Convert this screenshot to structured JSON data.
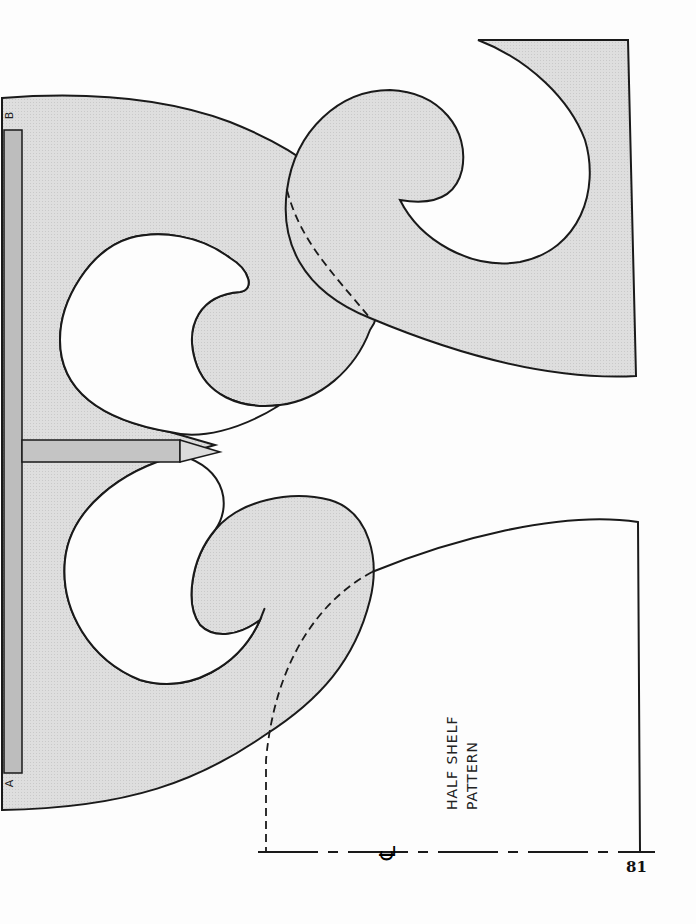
{
  "page": {
    "number": "81",
    "pattern_label_lines": [
      "HALF SHELF",
      "PATTERN"
    ],
    "edge_marks": {
      "top": "B",
      "bottom": "A"
    },
    "centerline_symbol": "℄"
  },
  "colors": {
    "fill": "#dcdcdc",
    "strip_fill": "#bdbdbd",
    "stroke": "#1a1a1a",
    "background": "#fdfdfd"
  }
}
